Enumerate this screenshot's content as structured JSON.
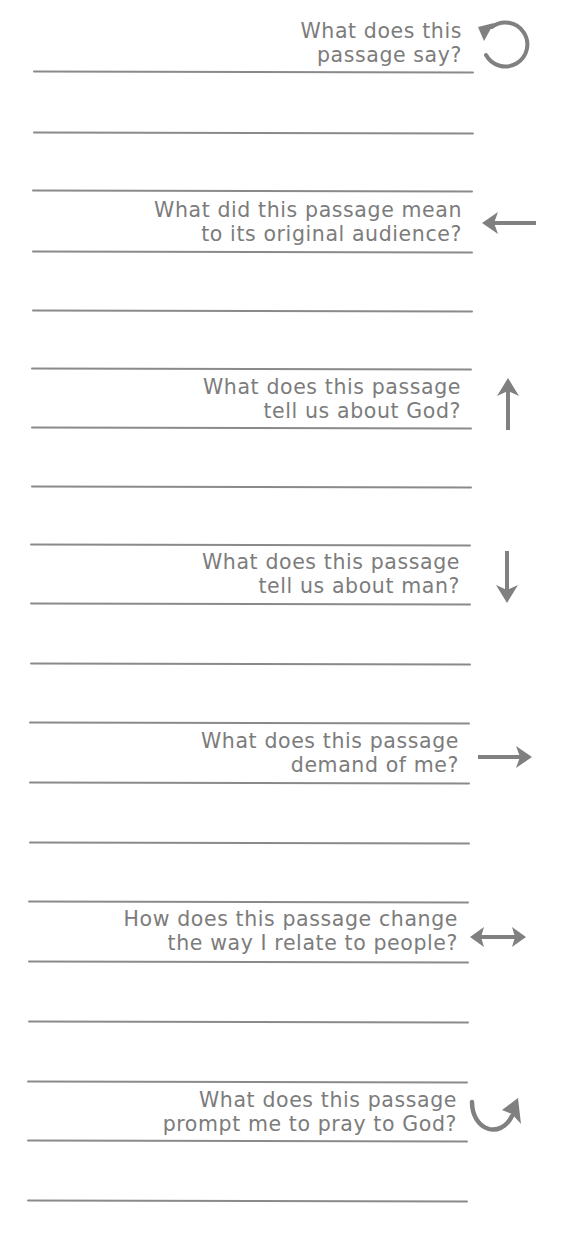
{
  "worksheet": {
    "colors": {
      "text": "#7c7c7c",
      "rule": "#8a8a8a",
      "icon": "#808080",
      "background": "#ffffff"
    },
    "sections": [
      {
        "icon": "counterclockwise-circle-arrow-icon",
        "lines": [
          "What does this",
          "passage say?"
        ]
      },
      {
        "icon": "arrow-left-icon",
        "lines": [
          "What did this passage mean",
          "to its original audience?"
        ]
      },
      {
        "icon": "arrow-up-icon",
        "lines": [
          "What does this passage",
          "tell us about God?"
        ]
      },
      {
        "icon": "arrow-down-icon",
        "lines": [
          "What does this passage",
          "tell us about man?"
        ]
      },
      {
        "icon": "arrow-right-icon",
        "lines": [
          "What does this passage",
          "demand of me?"
        ]
      },
      {
        "icon": "arrow-left-right-icon",
        "lines": [
          "How does this passage change",
          "the way I relate to people?"
        ]
      },
      {
        "icon": "curved-arrow-up-right-icon",
        "lines": [
          "What does this passage",
          "prompt me to pray to God?"
        ]
      }
    ]
  }
}
